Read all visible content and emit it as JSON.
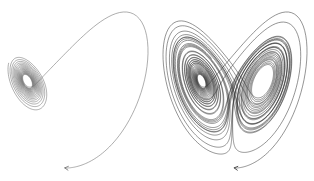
{
  "figure": {
    "background": "#ffffff",
    "stroke_color_left": "#6a6a6a",
    "stroke_color_right": "#2a2a2a",
    "panels": [
      {
        "id": "short-trajectory",
        "sigma": 10,
        "rho": 28,
        "beta": 2.6667,
        "start": [
          0.5,
          0.5,
          0.5
        ],
        "dt": 0.005,
        "steps": 2600,
        "stroke_width": 0.55,
        "start_marker": "arrow",
        "bbox": [
          8,
          12,
          148,
          168
        ]
      },
      {
        "id": "long-trajectory",
        "sigma": 10,
        "rho": 28,
        "beta": 2.6667,
        "start": [
          0.5,
          0.5,
          0.5
        ],
        "dt": 0.005,
        "steps": 9000,
        "stroke_width": 0.5,
        "start_marker": "arrow",
        "bbox": [
          6,
          12,
          150,
          168
        ]
      }
    ]
  }
}
